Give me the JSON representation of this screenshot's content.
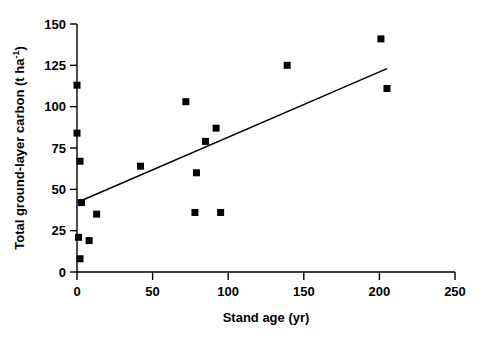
{
  "figure": {
    "background": "#ffffff",
    "ink_color": "#000000"
  },
  "chart_data": {
    "type": "scatter",
    "title": "",
    "subtitle": "",
    "xlabel": "Stand age (yr)",
    "ylabel_text": "Total ground-layer carbon (t ha",
    "ylabel_sup": "-1",
    "ylabel_tail": ")",
    "ylabel_full": "Total ground-layer carbon (t ha-1)",
    "xlim": [
      0,
      250
    ],
    "ylim": [
      0,
      150
    ],
    "xticks": [
      0,
      50,
      100,
      150,
      200,
      250
    ],
    "yticks": [
      0,
      25,
      50,
      75,
      100,
      125,
      150
    ],
    "xtick_labels": [
      "0",
      "50",
      "100",
      "150",
      "200",
      "250"
    ],
    "ytick_labels": [
      "0",
      "25",
      "50",
      "75",
      "100",
      "125",
      "150"
    ],
    "grid": false,
    "legend": false,
    "legend_position": "none",
    "marker": "square",
    "marker_color": "#000000",
    "marker_size": 7,
    "series": [
      {
        "name": "Stand age vs total ground-layer carbon",
        "points": [
          {
            "x": 0,
            "y": 113
          },
          {
            "x": 0,
            "y": 84
          },
          {
            "x": 2,
            "y": 67
          },
          {
            "x": 3,
            "y": 42
          },
          {
            "x": 1,
            "y": 21
          },
          {
            "x": 2,
            "y": 8
          },
          {
            "x": 8,
            "y": 19
          },
          {
            "x": 13,
            "y": 35
          },
          {
            "x": 42,
            "y": 64
          },
          {
            "x": 72,
            "y": 103
          },
          {
            "x": 78,
            "y": 36
          },
          {
            "x": 79,
            "y": 60
          },
          {
            "x": 85,
            "y": 79
          },
          {
            "x": 92,
            "y": 87
          },
          {
            "x": 95,
            "y": 36
          },
          {
            "x": 139,
            "y": 125
          },
          {
            "x": 201,
            "y": 141
          },
          {
            "x": 205,
            "y": 111
          }
        ]
      }
    ],
    "trend_line": {
      "name": "linear regression fit",
      "x_start": 0,
      "y_start": 42,
      "x_end": 205,
      "y_end": 123,
      "color": "#000000"
    }
  }
}
